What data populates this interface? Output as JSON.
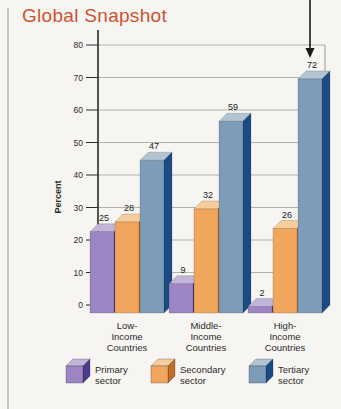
{
  "page": {
    "title": "Global Snapshot",
    "title_color": "#cc5231",
    "background_color": "#f7f5f1"
  },
  "chart_data": {
    "type": "bar",
    "variant": "3d-grouped",
    "title": "Global Snapshot",
    "ylabel": "Percent",
    "ylim": [
      0,
      80
    ],
    "yticks": [
      0,
      10,
      20,
      30,
      40,
      50,
      60,
      70,
      80
    ],
    "grid": true,
    "legend_position": "bottom",
    "categories": [
      "Low-Income Countries",
      "Middle-Income Countries",
      "High-Income Countries"
    ],
    "category_lines": [
      [
        "Low-",
        "Income",
        "Countries"
      ],
      [
        "Middle-",
        "Income",
        "Countries"
      ],
      [
        "High-",
        "Income",
        "Countries"
      ]
    ],
    "series": [
      {
        "name": "Primary sector",
        "legend_lines": [
          "Primary",
          "sector"
        ],
        "values": [
          25,
          9,
          2
        ],
        "colors": {
          "front": "#9c85c2",
          "top": "#c3b4da",
          "side": "#4e3a8c"
        }
      },
      {
        "name": "Secondary sector",
        "legend_lines": [
          "Secondary",
          "sector"
        ],
        "values": [
          28,
          32,
          26
        ],
        "colors": {
          "front": "#f2a65d",
          "top": "#f6cd9b",
          "side": "#c06f22"
        }
      },
      {
        "name": "Tertiary sector",
        "legend_lines": [
          "Tertiary",
          "sector"
        ],
        "values": [
          47,
          59,
          72
        ],
        "colors": {
          "front": "#7d9cba",
          "top": "#b2c4d2",
          "side": "#1b4b84"
        }
      }
    ],
    "annotation": {
      "type": "arrow-down",
      "target_series": 2,
      "target_category": 2,
      "points_to_value": 72
    }
  }
}
